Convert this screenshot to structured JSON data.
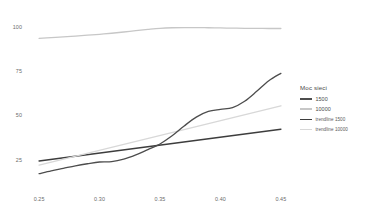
{
  "chart_data": {
    "type": "line",
    "title": "",
    "xlabel": "",
    "ylabel": "",
    "xlim": [
      0.2375,
      0.4625
    ],
    "ylim": [
      10,
      104
    ],
    "grid": false,
    "xticks": [
      "0.25",
      "0.30",
      "0.35",
      "0.40",
      "0.45"
    ],
    "xtick_values": [
      0.25,
      0.3,
      0.35,
      0.4,
      0.45
    ],
    "yticks": [
      "25",
      "50",
      "75",
      "100"
    ],
    "ytick_values": [
      25,
      50,
      75,
      100
    ],
    "x": [
      0.25,
      0.26,
      0.27,
      0.28,
      0.29,
      0.3,
      0.31,
      0.32,
      0.33,
      0.34,
      0.35,
      0.36,
      0.37,
      0.38,
      0.39,
      0.4,
      0.41,
      0.42,
      0.43,
      0.44,
      0.45
    ],
    "series": [
      {
        "name": "1500",
        "color": "#4d4d4d",
        "width": 1.3,
        "style": "solid",
        "values": [
          17.0,
          18.6,
          20.0,
          21.4,
          22.6,
          23.6,
          23.8,
          25.2,
          27.6,
          30.6,
          33.8,
          38.4,
          44.0,
          49.0,
          52.2,
          53.4,
          54.4,
          58.0,
          63.6,
          69.6,
          73.8
        ]
      },
      {
        "name": "10000",
        "color": "#c7c7c7",
        "width": 1.3,
        "style": "solid",
        "values": [
          93.6,
          94.0,
          94.4,
          94.9,
          95.4,
          95.9,
          96.5,
          97.2,
          98.0,
          98.7,
          99.3,
          99.6,
          99.7,
          99.7,
          99.6,
          99.5,
          99.4,
          99.3,
          99.3,
          99.2,
          99.2
        ]
      }
    ],
    "trendlines": [
      {
        "name": "trend-1500",
        "label": "trendline 1500",
        "color": "#3d3d3d",
        "width": 1.5,
        "x0": 0.25,
        "y0": 24.2,
        "x1": 0.45,
        "y1": 42.2
      },
      {
        "name": "trend-10000",
        "label": "trendline 10000",
        "color": "#d8d8d8",
        "width": 1.4,
        "x0": 0.25,
        "y0": 21.8,
        "x1": 0.45,
        "y1": 55.4
      }
    ]
  },
  "legend": {
    "title": "Moc sieci",
    "entries": [
      {
        "label": "1500",
        "color": "#4d4d4d",
        "thin": false,
        "small": false
      },
      {
        "label": "10000",
        "color": "#c7c7c7",
        "thin": false,
        "small": false
      },
      {
        "label": "trendline 1500",
        "color": "#3d3d3d",
        "thin": true,
        "small": true
      },
      {
        "label": "trendline 10000",
        "color": "#d8d8d8",
        "thin": true,
        "small": true
      }
    ]
  },
  "colors": {
    "background": "#ffffff",
    "tick_text": "#6b6b6b",
    "legend_text": "#4a4a4a",
    "series_1500": "#4d4d4d",
    "series_10000": "#c7c7c7",
    "trend_1500": "#3d3d3d",
    "trend_10000": "#d8d8d8"
  }
}
